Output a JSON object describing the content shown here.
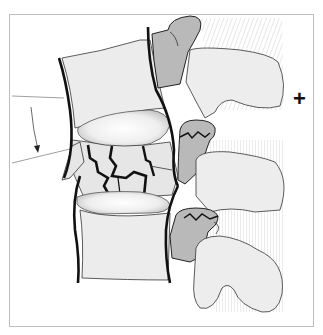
{
  "figure": {
    "annotations": {
      "plus_marker": "+"
    },
    "colors": {
      "background": "#ffffff",
      "frame": "#bdbdbd",
      "vertebral_body_fill": "#ececec",
      "pedicle_fill": "#b9b9b9",
      "process_fill": "#ededed",
      "disc_fill": "#f4f4f4",
      "ligament_line": "#111111",
      "hatch": "#dcdcdc"
    }
  }
}
